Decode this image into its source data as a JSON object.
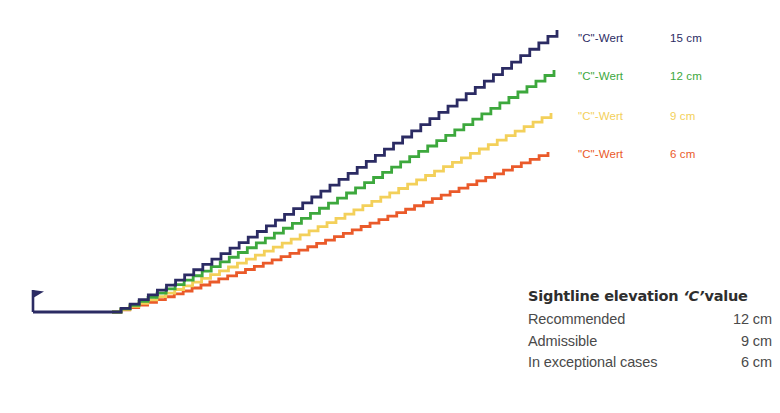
{
  "chart_data": {
    "type": "line",
    "title": "",
    "xlabel": "",
    "ylabel": "",
    "grid": false,
    "legend_position": "right",
    "series": [
      {
        "name": "\"C\"-Wert 15 cm",
        "legend_label": "\"C\"-Wert",
        "legend_value": "15 cm",
        "color": "#2b2b63",
        "c_value_cm": 15,
        "steps": 49,
        "start": [
          112,
          312
        ],
        "end": [
          557,
          30
        ],
        "rise_per_step_px": 5.75,
        "run_per_step_px": 9.1
      },
      {
        "name": "\"C\"-Wert 12 cm",
        "legend_label": "\"C\"-Wert",
        "legend_value": "12 cm",
        "color": "#3da83d",
        "c_value_cm": 12,
        "steps": 49,
        "start": [
          112,
          312
        ],
        "end": [
          554,
          70
        ],
        "rise_per_step_px": 4.94,
        "run_per_step_px": 9.02
      },
      {
        "name": "\"C\"-Wert 9 cm",
        "legend_label": "\"C\"-Wert",
        "legend_value": "9 cm",
        "color": "#f3d05a",
        "c_value_cm": 9,
        "steps": 49,
        "start": [
          112,
          312
        ],
        "end": [
          551,
          113
        ],
        "rise_per_step_px": 4.06,
        "run_per_step_px": 8.96
      },
      {
        "name": "\"C\"-Wert 6 cm",
        "legend_label": "\"C\"-Wert",
        "legend_value": "6 cm",
        "color": "#ea5a2a",
        "c_value_cm": 6,
        "steps": 49,
        "start": [
          112,
          312
        ],
        "end": [
          548,
          152
        ],
        "rise_per_step_px": 3.27,
        "run_per_step_px": 8.9
      }
    ],
    "baseline": {
      "name": "pitch-baseline",
      "color": "#2b2b63",
      "from": [
        33,
        312
      ],
      "to": [
        112,
        312
      ]
    },
    "corner_flag": {
      "name": "corner-flag",
      "color": "#2b2b63",
      "post_x": 33,
      "post_top_y": 290,
      "post_bottom_y": 312,
      "flag_width": 11,
      "flag_height": 8
    }
  },
  "legend": {
    "rows": [
      {
        "label": "\"C\"-Wert",
        "value": "15 cm",
        "color": "#2b2b63"
      },
      {
        "label": "\"C\"-Wert",
        "value": "12 cm",
        "color": "#3da83d"
      },
      {
        "label": "\"C\"-Wert",
        "value": "9 cm",
        "color": "#f3d05a"
      },
      {
        "label": "\"C\"-Wert",
        "value": "6 cm",
        "color": "#ea5a2a"
      }
    ]
  },
  "info_table": {
    "title_prefix": "Sightline elevation ",
    "title_cvar": "‘C’",
    "title_suffix": "value",
    "rows": [
      {
        "label": "Recommended",
        "value": "12 cm"
      },
      {
        "label": "Admissible",
        "value": "9 cm"
      },
      {
        "label": "In exceptional cases",
        "value": "6 cm"
      }
    ]
  }
}
